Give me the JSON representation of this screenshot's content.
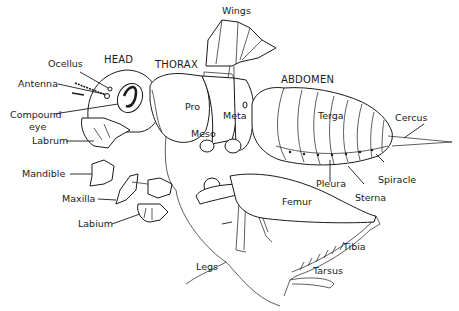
{
  "diagram": {
    "colors": {
      "line": "#1a1a1a",
      "background": "#ffffff"
    },
    "regions": {
      "head": "HEAD",
      "thorax": "THORAX",
      "abdomen": "ABDOMEN"
    },
    "labels": {
      "wings": "Wings",
      "ocellus": "Ocellus",
      "antenna": "Antenna",
      "compound_eye_line1": "Compound",
      "compound_eye_line2": "eye",
      "labrum": "Labrum",
      "mandible": "Mandible",
      "maxilla": "Maxilla",
      "labium": "Labium",
      "pro": "Pro",
      "meso": "Meso",
      "meta": "Meta",
      "terga": "Terga",
      "cercus": "Cercus",
      "spiracle": "Spiracle",
      "pleura": "Pleura",
      "sterna": "Sterna",
      "femur": "Femur",
      "tibia": "Tibia",
      "tarsus": "Tarsus",
      "legs": "Legs"
    }
  }
}
